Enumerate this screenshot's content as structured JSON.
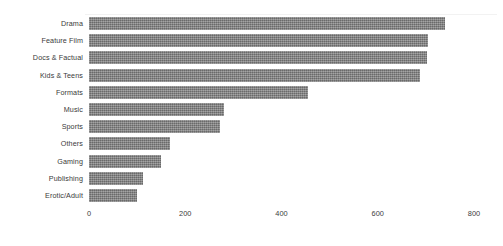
{
  "chart_data": {
    "type": "bar",
    "orientation": "horizontal",
    "title": "",
    "subtitle": "",
    "xlabel": "",
    "ylabel": "",
    "categories": [
      "Drama",
      "Feature Film",
      "Docs & Factual",
      "Kids & Teens",
      "Formats",
      "Music",
      "Sports",
      "Others",
      "Gaming",
      "Publishing",
      "Erotic/Adult"
    ],
    "values": [
      740,
      705,
      703,
      688,
      455,
      281,
      272,
      168,
      150,
      112,
      100
    ],
    "xlim": [
      0,
      800
    ],
    "xticks": [
      0,
      200,
      400,
      600,
      800
    ],
    "xtick_labels": [
      "0",
      "200",
      "400",
      "600",
      "800"
    ],
    "grid": false,
    "legend": false,
    "legend_position": "none",
    "bar_color": "#808080",
    "background_color": "#ffffff",
    "text_color": "#3a3a3a"
  }
}
